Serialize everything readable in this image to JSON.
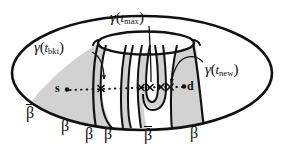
{
  "figure": {
    "caption_alt": "Topological disk with central crater and shaded beta bands",
    "background_color": "#ffffff",
    "ink_color": "#111111",
    "shade_color": "#d2d2d2",
    "shade_color_light": "#dedede"
  },
  "curve_labels": [
    {
      "id": "gamma-t-max",
      "gamma": "γ",
      "open_paren": "(",
      "t": "t",
      "subscript": "max",
      "close_paren": ")",
      "full": "γ(t_max)"
    },
    {
      "id": "gamma-t-bkt",
      "gamma": "γ",
      "open_paren": "(",
      "t": "t",
      "subscript": "bkt",
      "close_paren": ")",
      "full": "γ(t_bkt)"
    },
    {
      "id": "gamma-t-new",
      "gamma": "γ",
      "open_paren": "(",
      "t": "t",
      "subscript": "new",
      "close_paren": ")",
      "full": "γ(t_new)"
    }
  ],
  "boundary_labels": [
    {
      "id": "beta-bar-1",
      "glyph": "β",
      "barred": true,
      "text": "β̄"
    },
    {
      "id": "beta-1",
      "glyph": "β",
      "barred": false,
      "text": "β"
    },
    {
      "id": "beta-bar-2",
      "glyph": "β",
      "barred": true,
      "text": "β̄"
    },
    {
      "id": "beta-2",
      "glyph": "β",
      "barred": false,
      "text": "β"
    },
    {
      "id": "beta-bar-3",
      "glyph": "β",
      "barred": true,
      "text": "β̄"
    },
    {
      "id": "beta-3",
      "glyph": "β",
      "barred": false,
      "text": "β"
    }
  ],
  "path_endpoints": {
    "source": "s",
    "destination": "d"
  },
  "path": {
    "style": "dotted",
    "crossing_marker": "x",
    "crossing_count": 5
  }
}
